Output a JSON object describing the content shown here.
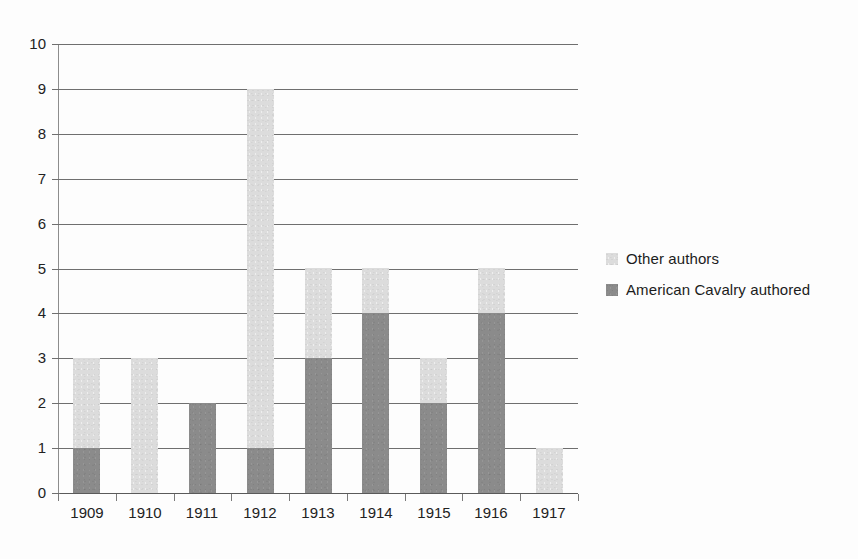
{
  "chart_data": {
    "type": "bar",
    "subtype": "stacked-vertical",
    "title": "",
    "subtitle": "",
    "xlabel": "",
    "ylabel": "",
    "categories": [
      "1909",
      "1910",
      "1911",
      "1912",
      "1913",
      "1914",
      "1915",
      "1916",
      "1917"
    ],
    "series": [
      {
        "name": "American Cavalry authored",
        "color": "#8b8b8b",
        "values": [
          1,
          0,
          2,
          1,
          3,
          4,
          2,
          4,
          0
        ]
      },
      {
        "name": "Other authors",
        "color": "#dcdcdc",
        "values": [
          2,
          3,
          0,
          8,
          2,
          1,
          1,
          1,
          1
        ]
      }
    ],
    "stack_order_bottom_to_top": [
      "American Cavalry authored",
      "Other authors"
    ],
    "totals": [
      3,
      3,
      2,
      9,
      5,
      5,
      3,
      5,
      1
    ],
    "ylim": [
      0,
      10
    ],
    "ytick_labels": [
      "0",
      "1",
      "2",
      "3",
      "4",
      "5",
      "6",
      "7",
      "8",
      "9",
      "10"
    ],
    "ytick_values": [
      0,
      1,
      2,
      3,
      4,
      5,
      6,
      7,
      8,
      9,
      10
    ],
    "grid": "horizontal",
    "legend_position": "right",
    "legend": [
      {
        "label": "Other authors",
        "swatch_color": "#dcdcdc",
        "swatch_name": "legend-swatch-other-authors"
      },
      {
        "label": "American Cavalry authored",
        "swatch_color": "#8b8b8b",
        "swatch_name": "legend-swatch-american-cavalry"
      }
    ],
    "annotations": [],
    "colors": {
      "background": "#fdfdfd",
      "gridline": "#6f6f6f",
      "axis": "#8d8d8d",
      "text": "#222222",
      "light_series": "#dcdcdc",
      "dark_series": "#8b8b8b"
    }
  }
}
